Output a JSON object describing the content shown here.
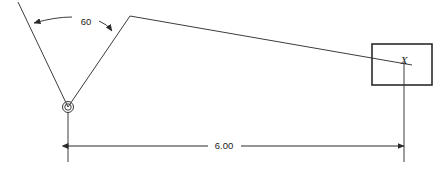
{
  "drawing": {
    "background_color": "#ffffff",
    "line_color": "#3c3c3c",
    "box_color": "#2b2b2b",
    "text_color": "#1a1a1a",
    "angle": {
      "value": "60",
      "units": "degrees",
      "label_x": 86,
      "label_y": 25
    },
    "dimension": {
      "value": "6.00",
      "label_x": 224,
      "label_y": 149,
      "left_x": 68,
      "right_x": 404,
      "line_y": 146
    },
    "target_point": {
      "label": "X",
      "label_x": 404,
      "label_y": 64
    },
    "vertex_marker": {
      "cx": 68,
      "cy": 107,
      "r_outer": 5.5,
      "r_inner": 3.2
    },
    "geometry": {
      "ray_upper_left": {
        "x1": 18,
        "y1": 2,
        "x2": 68,
        "y2": 107
      },
      "ray_peak": {
        "x1": 68,
        "y1": 107,
        "x2": 130,
        "y2": 16
      },
      "line_to_box": {
        "x1": 130,
        "y1": 16,
        "x2": 412,
        "y2": 65
      },
      "box": {
        "x": 372,
        "y": 44,
        "width": 60,
        "height": 41
      },
      "ext_line_left": {
        "x": 68,
        "y1": 112,
        "y2": 162
      },
      "ext_line_right": {
        "x": 404,
        "y1": 62,
        "y2": 162
      }
    }
  }
}
